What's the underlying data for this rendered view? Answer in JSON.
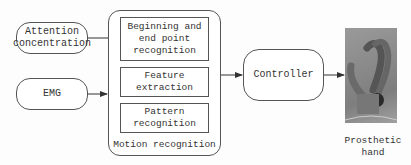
{
  "inputs": [
    {
      "label": "Attention concentration"
    },
    {
      "label": "EMG"
    }
  ],
  "motion_recognition": {
    "title": "Motion recognition",
    "steps": [
      {
        "label": "Beginning and end point recognition"
      },
      {
        "label": "Feature extraction"
      },
      {
        "label": "Pattern recognition"
      }
    ]
  },
  "controller": {
    "label": "Controller"
  },
  "output": {
    "label": "Prosthetic hand",
    "image": "prosthetic-hand-photo"
  }
}
